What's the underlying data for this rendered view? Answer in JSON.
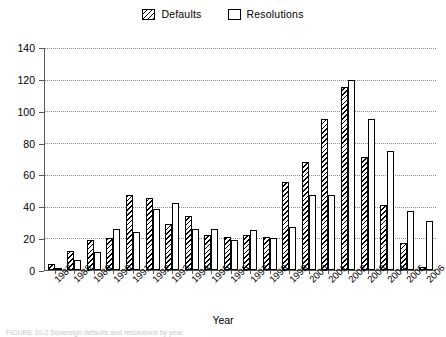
{
  "legend": {
    "position": "top-center",
    "items": [
      {
        "label": "Defaults",
        "style": "hatched",
        "icon": "hatched-square-icon"
      },
      {
        "label": "Resolutions",
        "style": "empty",
        "icon": "empty-square-icon"
      }
    ]
  },
  "axis": {
    "x_title": "Year",
    "y_title": "",
    "y_ticks": [
      0,
      20,
      40,
      60,
      80,
      100,
      120,
      140
    ]
  },
  "caption": "FIGURE 10-2   Sovereign defaults and resolutions by year.",
  "chart_data": {
    "type": "bar",
    "title": "",
    "xlabel": "Year",
    "ylabel": "",
    "ylim": [
      0,
      140
    ],
    "grid": true,
    "legend_position": "top-center",
    "categories": [
      "1987",
      "1988",
      "1989",
      "1990",
      "1991",
      "1992",
      "1993",
      "1994",
      "1995",
      "1996",
      "1997",
      "1998",
      "1999",
      "2000",
      "2001",
      "2002",
      "2003",
      "2004",
      "2005",
      "2006"
    ],
    "series": [
      {
        "name": "Defaults",
        "values": [
          4,
          12,
          19,
          20,
          47,
          45,
          29,
          34,
          22,
          21,
          22,
          21,
          55,
          68,
          95,
          115,
          71,
          41,
          17,
          2
        ]
      },
      {
        "name": "Resolutions",
        "values": [
          1,
          6,
          11,
          26,
          24,
          38,
          42,
          26,
          26,
          19,
          25,
          20,
          27,
          47,
          47,
          119,
          95,
          75,
          37,
          31
        ]
      }
    ]
  }
}
